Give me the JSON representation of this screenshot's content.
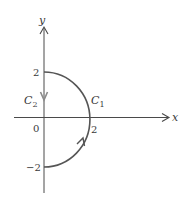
{
  "diagram": {
    "axes": {
      "x_label": "x",
      "y_label": "y",
      "origin_label": "0"
    },
    "ticks": {
      "y_top": "2",
      "y_bottom": "−2",
      "x_right": "2"
    },
    "curves": [
      {
        "name": "C",
        "subscript": "1",
        "description": "right semicircle of radius 2 from (0,-2) to (0,2), counterclockwise"
      },
      {
        "name": "C",
        "subscript": "2",
        "description": "segment on y-axis from (0,2) down to (0,-2)"
      }
    ],
    "colors": {
      "axis": "#4a4a4a",
      "curve": "#555555",
      "arrow_c2": "#8a8a8a"
    }
  }
}
